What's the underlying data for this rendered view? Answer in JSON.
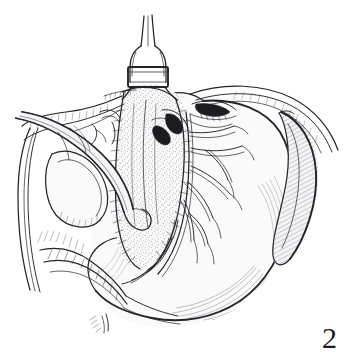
{
  "figure": {
    "number": "2",
    "caption_text": "2",
    "background_color": "#ffffff",
    "ink_color": "#23232a",
    "width": 349,
    "height": 363,
    "style": "pen-and-ink line drawing"
  },
  "regions": {
    "top_tube": {
      "name": "tubular-structure-with-clamp",
      "label": "",
      "band_label": ""
    },
    "left_instrument": {
      "name": "retractor-band",
      "label": ""
    },
    "center": {
      "name": "stippled-membrane",
      "label": ""
    },
    "right_organ": {
      "name": "spleen",
      "label": ""
    },
    "main_organ": {
      "name": "stomach",
      "label": ""
    },
    "vessels": {
      "name": "vascular-arcade",
      "label": ""
    }
  }
}
